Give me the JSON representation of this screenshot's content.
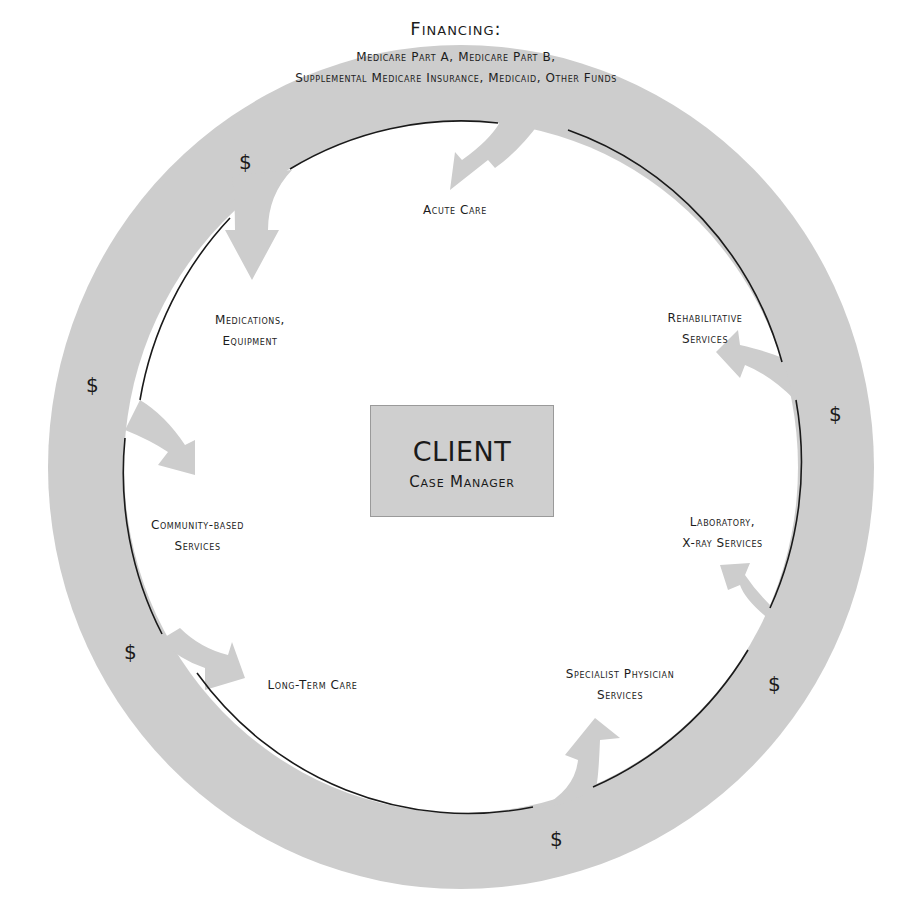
{
  "financing": {
    "title": "Financing:",
    "line1": "Medicare Part A, Medicare Part B,",
    "line2": "Supplemental Medicare Insurance, Medicaid, Other Funds"
  },
  "center": {
    "title": "CLIENT",
    "subtitle": "Case Manager"
  },
  "services": [
    {
      "id": "acute-care",
      "lines": [
        "Acute Care"
      ]
    },
    {
      "id": "rehabilitative-services",
      "lines": [
        "Rehabilitative",
        "Services"
      ]
    },
    {
      "id": "laboratory-xray-services",
      "lines": [
        "Laboratory,",
        "X-ray Services"
      ]
    },
    {
      "id": "specialist-physician-services",
      "lines": [
        "Specialist Physician",
        "Services"
      ]
    },
    {
      "id": "long-term-care",
      "lines": [
        "Long-Term Care"
      ]
    },
    {
      "id": "community-based-services",
      "lines": [
        "Community-based",
        "Services"
      ]
    },
    {
      "id": "medications-equipment",
      "lines": [
        "Medications,",
        "Equipment"
      ]
    }
  ],
  "currency_symbol": "$",
  "colors": {
    "ring": "#cdcdcd",
    "inner_line": "#1a1a1a",
    "box": "#cfcfcf"
  }
}
